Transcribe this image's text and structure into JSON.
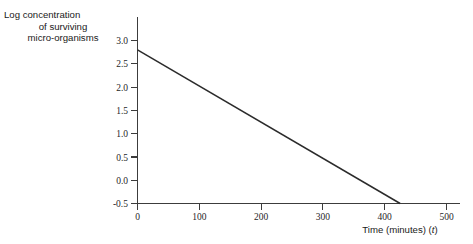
{
  "figure": {
    "background_color": "#ffffff",
    "axis_color": "#3c3c3c",
    "line_color": "#2b2b2b"
  },
  "ylabel": {
    "line1": "Log concentration",
    "line2": "of surviving",
    "line3": "micro-organisms"
  },
  "xlabel": {
    "text": "Time (minutes) ",
    "paren_open": "(",
    "variable": "t",
    "paren_close": ")"
  },
  "chart_data": {
    "type": "line",
    "title": "",
    "subtitle": "",
    "xlabel": "Time (minutes) (t)",
    "ylabel": "Log concentration of surviving micro-organisms",
    "xlim": [
      0,
      520
    ],
    "ylim": [
      -0.5,
      3.3
    ],
    "grid": false,
    "legend": null,
    "legend_position": "none",
    "xticks": [
      0,
      100,
      200,
      300,
      400,
      500
    ],
    "xtick_labels": [
      "0",
      "100",
      "200",
      "300",
      "400",
      "500"
    ],
    "yticks": [
      3.0,
      2.5,
      2.0,
      1.5,
      1.0,
      0.5,
      0.0,
      -0.5
    ],
    "ytick_labels": [
      "3.0",
      "2.5",
      "2.0",
      "1.5",
      "1.0",
      "0.5",
      "0.0",
      "-0.5"
    ],
    "series": [
      {
        "name": "Log concentration of surviving micro-organisms",
        "color": "#2b2b2b",
        "x": [
          0,
          425
        ],
        "values": [
          2.8,
          -0.5
        ],
        "slope": -0.00776,
        "intercept": 2.8
      }
    ],
    "annotations": []
  }
}
